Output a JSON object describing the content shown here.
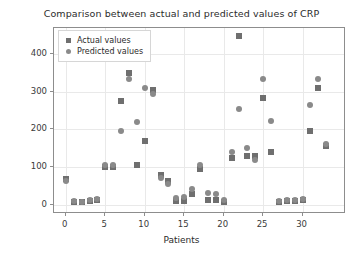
{
  "chart_data": {
    "type": "scatter",
    "title": "Comparison between actual and predicted values of CRP",
    "xlabel": "Patients",
    "ylabel": "Value of CRP",
    "xlim": [
      -1.5,
      35.5
    ],
    "ylim": [
      -25,
      470
    ],
    "xticks": [
      0,
      5,
      10,
      15,
      20,
      25,
      30
    ],
    "yticks": [
      0,
      100,
      200,
      300,
      400
    ],
    "grid": true,
    "legend_position": "upper left",
    "legend": [
      "Actual values",
      "Predicted values"
    ],
    "x": [
      0,
      1,
      2,
      3,
      4,
      5,
      6,
      7,
      8,
      9,
      10,
      11,
      12,
      13,
      14,
      15,
      16,
      17,
      18,
      19,
      20,
      21,
      22,
      23,
      24,
      25,
      26,
      27,
      28,
      29,
      30,
      31,
      32,
      33
    ],
    "series": [
      {
        "name": "Actual values",
        "marker": "square",
        "color": "#6f6f6f",
        "values": [
          68,
          8,
          6,
          10,
          12,
          100,
          100,
          275,
          350,
          105,
          170,
          305,
          78,
          62,
          10,
          10,
          28,
          95,
          12,
          12,
          8,
          125,
          450,
          130,
          130,
          285,
          140,
          8,
          10,
          10,
          12,
          195,
          310,
          155
        ]
      },
      {
        "name": "Predicted values",
        "marker": "circle",
        "color": "#8a8a8a",
        "values": [
          62,
          10,
          8,
          12,
          14,
          105,
          105,
          195,
          335,
          220,
          310,
          295,
          70,
          55,
          18,
          20,
          42,
          105,
          30,
          28,
          12,
          140,
          255,
          150,
          120,
          335,
          222,
          10,
          12,
          12,
          14,
          265,
          335,
          160
        ]
      }
    ]
  }
}
